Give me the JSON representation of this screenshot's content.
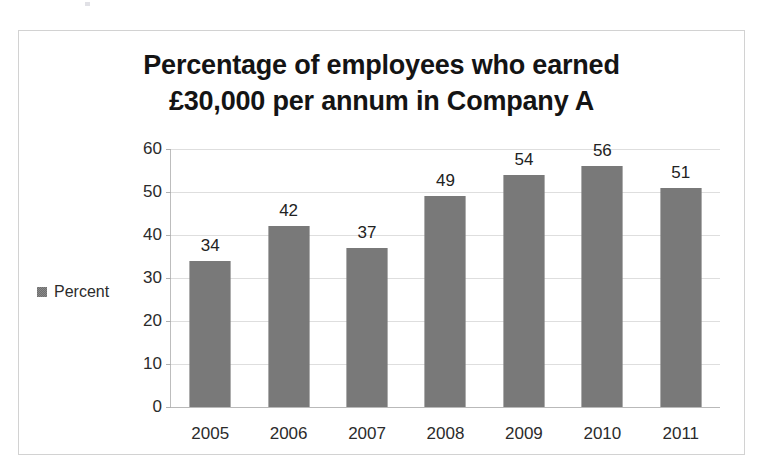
{
  "page": {
    "background": "#ffffff",
    "artifact_name": "scan-speck"
  },
  "chart_frame": {
    "border_color": "#d2d2d2"
  },
  "legend": {
    "position": "left-middle",
    "entries": [
      {
        "label": "Percent",
        "color": "#858585"
      }
    ]
  },
  "chart_data": {
    "type": "bar",
    "title": "Percentage of employees who earned £30,000 per annum in Company A",
    "title_lines": [
      "Percentage of employees who earned",
      "£30,000 per annum in Company A"
    ],
    "categories": [
      "2005",
      "2006",
      "2007",
      "2008",
      "2009",
      "2010",
      "2011"
    ],
    "values": [
      34,
      42,
      37,
      49,
      54,
      56,
      51
    ],
    "series": [
      {
        "name": "Percent",
        "values": [
          34,
          42,
          37,
          49,
          54,
          56,
          51
        ],
        "color": "#858585"
      }
    ],
    "data_labels": [
      "34",
      "42",
      "37",
      "49",
      "54",
      "56",
      "51"
    ],
    "xlabel": "",
    "ylabel": "",
    "ylim": [
      0,
      60
    ],
    "ytick_values": [
      0,
      10,
      20,
      30,
      40,
      50,
      60
    ],
    "ytick_labels": [
      "0",
      "10",
      "20",
      "30",
      "40",
      "50",
      "60"
    ],
    "grid": true,
    "grid_axis": "y",
    "legend_position": "left",
    "bar_color": "#858585",
    "gridline_color": "#dedede"
  }
}
